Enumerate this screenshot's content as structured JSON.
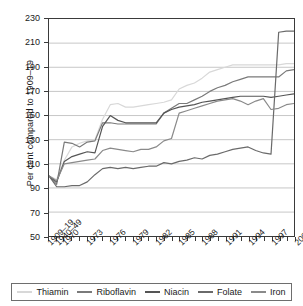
{
  "chart_data": {
    "type": "line",
    "title": "",
    "xlabel": "",
    "ylabel": "Per cent compared to 1909–19",
    "ylim": [
      50,
      230
    ],
    "ytick_step": 20,
    "yticks": [
      230,
      210,
      190,
      170,
      150,
      130,
      110,
      90,
      70,
      50
    ],
    "grid": true,
    "legend_position": "bottom",
    "categories": [
      "1909–19",
      "1940–49",
      "1970",
      "1971",
      "1972",
      "1973",
      "1974",
      "1975",
      "1976",
      "1977",
      "1978",
      "1979",
      "1980",
      "1981",
      "1982",
      "1983",
      "1984",
      "1985",
      "1986",
      "1987",
      "1988",
      "1989",
      "1990",
      "1991",
      "1992",
      "1993",
      "1994",
      "1995",
      "1996",
      "1997",
      "1998",
      "1999",
      "2000"
    ],
    "xtick_labels": [
      "1909–19",
      "1940–49",
      "1970",
      "1973",
      "1976",
      "1979",
      "1982",
      "1985",
      "1988",
      "1991",
      "1994",
      "1997",
      "2000"
    ],
    "series": [
      {
        "name": "Thiamin",
        "color": "#d8d8d8",
        "values": [
          100,
          97,
          113,
          124,
          127,
          129,
          130,
          147,
          159,
          160,
          157,
          157,
          158,
          159,
          160,
          161,
          163,
          172,
          175,
          177,
          181,
          186,
          188,
          190,
          192,
          192,
          192,
          192,
          192,
          192,
          192,
          193,
          193
        ]
      },
      {
        "name": "Riboflavin",
        "color": "#7a7a7a",
        "values": [
          100,
          93,
          128,
          127,
          124,
          128,
          129,
          144,
          144,
          143,
          143,
          143,
          143,
          143,
          143,
          152,
          156,
          160,
          160,
          163,
          166,
          170,
          173,
          175,
          178,
          180,
          182,
          182,
          182,
          182,
          182,
          187,
          188
        ]
      },
      {
        "name": "Niacin",
        "color": "#555555",
        "values": [
          100,
          95,
          112,
          116,
          118,
          120,
          119,
          141,
          150,
          146,
          144,
          144,
          144,
          144,
          144,
          152,
          155,
          157,
          158,
          159,
          161,
          162,
          163,
          164,
          165,
          166,
          166,
          166,
          166,
          165,
          166,
          167,
          168
        ]
      },
      {
        "name": "Folate",
        "color": "#6a6a6a",
        "values": [
          100,
          91,
          91,
          92,
          92,
          95,
          101,
          106,
          107,
          106,
          107,
          106,
          107,
          108,
          108,
          111,
          110,
          112,
          113,
          115,
          114,
          117,
          118,
          120,
          122,
          123,
          124,
          121,
          119,
          118,
          219,
          220,
          220
        ]
      },
      {
        "name": "Iron",
        "color": "#8a8a8a",
        "values": [
          100,
          96,
          110,
          111,
          112,
          113,
          114,
          121,
          123,
          122,
          121,
          120,
          122,
          122,
          124,
          129,
          131,
          152,
          154,
          156,
          158,
          160,
          162,
          163,
          164,
          162,
          159,
          162,
          164,
          155,
          156,
          159,
          160
        ]
      }
    ]
  },
  "legend": {
    "items": [
      {
        "label": "Thiamin"
      },
      {
        "label": "Riboflavin"
      },
      {
        "label": "Niacin"
      },
      {
        "label": "Folate"
      },
      {
        "label": "Iron"
      }
    ]
  }
}
